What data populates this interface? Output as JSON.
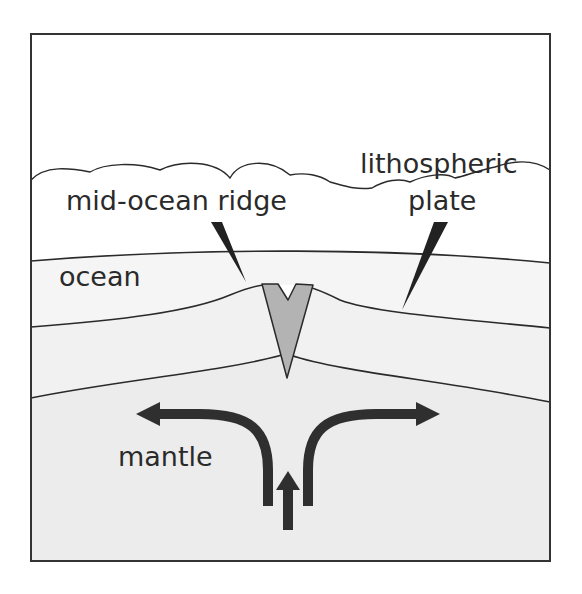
{
  "diagram": {
    "labels": {
      "lithospheric_line1": "lithospheric",
      "lithospheric_line2": "plate",
      "ridge": "mid-ocean ridge",
      "ocean": "ocean",
      "mantle": "mantle"
    },
    "colors": {
      "border": "#333333",
      "ocean_fill": "#f3f3f3",
      "plate_fill": "#eeeeee",
      "mantle_fill": "#ebebeb",
      "magma_fill": "#b3b3b3",
      "arrow": "#2f2f2f"
    }
  }
}
